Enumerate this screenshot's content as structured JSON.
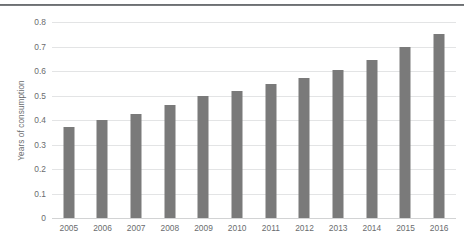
{
  "colors": {
    "bar": "#7a7a7a",
    "gridline": "#e3e4e5",
    "tick_text": "#6a6c6e",
    "top_rule": "#5e6164",
    "background": "#ffffff"
  },
  "top_rule": {
    "name": "page-top-rule"
  },
  "chart_data": {
    "type": "bar",
    "title": "",
    "subtitle": "",
    "xlabel": "",
    "ylabel": "Years of consumption",
    "categories": [
      "2005",
      "2006",
      "2007",
      "2008",
      "2009",
      "2010",
      "2011",
      "2012",
      "2013",
      "2014",
      "2015",
      "2016"
    ],
    "values": [
      0.37,
      0.4,
      0.425,
      0.46,
      0.5,
      0.52,
      0.545,
      0.57,
      0.605,
      0.645,
      0.7,
      0.75
    ],
    "ylim": [
      0,
      0.8
    ],
    "ytick_values": [
      0,
      0.1,
      0.2,
      0.3,
      0.4,
      0.5,
      0.6,
      0.7,
      0.8
    ],
    "ytick_labels": [
      "0",
      "0.1",
      "0.2",
      "0.3",
      "0.4",
      "0.5",
      "0.6",
      "0.7",
      "0.8"
    ],
    "grid": true,
    "grid_axis": "y",
    "legend": false,
    "legend_position": "none",
    "series": [
      {
        "name": "Years of consumption",
        "values": [
          0.37,
          0.4,
          0.425,
          0.46,
          0.5,
          0.52,
          0.545,
          0.57,
          0.605,
          0.645,
          0.7,
          0.75
        ]
      }
    ],
    "annotations": []
  }
}
